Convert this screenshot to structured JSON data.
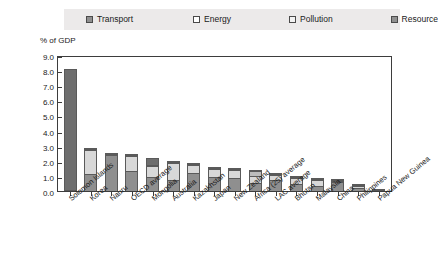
{
  "chart_data": {
    "type": "bar",
    "stacked": true,
    "title": "",
    "subtitle": "",
    "xlabel": "",
    "ylabel": "% of GDP",
    "ylim": [
      0.0,
      9.0
    ],
    "ytick_step": 1.0,
    "ytick_labels": [
      "9.0",
      "8.0",
      "7.0",
      "6.0",
      "5.0",
      "4.0",
      "3.0",
      "2.0",
      "1.0",
      "0.0"
    ],
    "ytick_values": [
      9.0,
      8.0,
      7.0,
      6.0,
      5.0,
      4.0,
      3.0,
      2.0,
      1.0,
      0.0
    ],
    "grid": false,
    "legend_position": "top",
    "categories": [
      "Solomon Islands",
      "Korea",
      "Nauru",
      "OECD average",
      "Mongolia",
      "Australia",
      "Kazakhstan",
      "Japan",
      "New Zealand",
      "Africa (25) average",
      "LAC average",
      "Bhutan",
      "Malaysia",
      "China",
      "Philippines",
      "Papua New Guinea"
    ],
    "series": [
      {
        "name": "Transport",
        "color": "#8f8f8f",
        "values": [
          0.05,
          1.1,
          2.4,
          1.3,
          0.95,
          0.75,
          1.2,
          0.9,
          0.85,
          0.55,
          0.7,
          0.45,
          0.3,
          0.6,
          0.22,
          0.1
        ]
      },
      {
        "name": "Energy",
        "color": "#d8d8d8",
        "values": [
          0.0,
          1.6,
          0.05,
          1.05,
          0.7,
          1.1,
          0.55,
          0.55,
          0.55,
          0.45,
          0.35,
          0.4,
          0.45,
          0.05,
          0.12,
          0.05
        ]
      },
      {
        "name": "Pollution",
        "color": "#bcbcbc",
        "values": [
          0.0,
          0.05,
          0.0,
          0.05,
          0.05,
          0.05,
          0.05,
          0.05,
          0.05,
          0.3,
          0.05,
          0.05,
          0.05,
          0.05,
          0.02,
          0.0
        ]
      },
      {
        "name": "Resource",
        "color": "#6e6e6e",
        "values": [
          8.0,
          0.05,
          0.05,
          0.05,
          0.45,
          0.05,
          0.05,
          0.05,
          0.05,
          0.05,
          0.05,
          0.05,
          0.05,
          0.05,
          0.02,
          0.0
        ]
      }
    ],
    "totals": [
      8.05,
      2.8,
      2.5,
      2.45,
      2.15,
      1.95,
      1.85,
      1.55,
      1.5,
      1.35,
      1.15,
      0.95,
      0.85,
      0.75,
      0.38,
      0.15
    ]
  },
  "legend": {
    "items": [
      {
        "label": "Transport",
        "swatch": "transport",
        "color": "#8f8f8f"
      },
      {
        "label": "Energy",
        "swatch": "energy",
        "color": "#d8d8d8"
      },
      {
        "label": "Pollution",
        "swatch": "pollution",
        "color": "#bcbcbc"
      },
      {
        "label": "Resource",
        "swatch": "resource",
        "color": "#6e6e6e"
      }
    ]
  }
}
